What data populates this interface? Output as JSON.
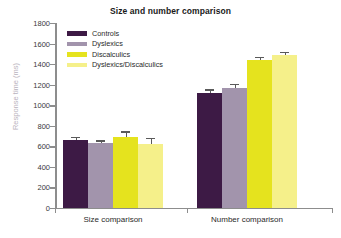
{
  "chart_data": {
    "type": "bar",
    "title": "Size and number comparison",
    "xlabel": "",
    "ylabel": "Response time (ms)",
    "ylim": [
      0,
      1800
    ],
    "ytick_step": 200,
    "yticks": [
      0,
      200,
      400,
      600,
      800,
      1000,
      1200,
      1400,
      1600,
      1800
    ],
    "grid": false,
    "legend_position": "top-left-inside",
    "categories": [
      "Size comparison",
      "Number comparison"
    ],
    "series": [
      {
        "name": "Controls",
        "color": "#3D1A45",
        "values": [
          660,
          1115
        ],
        "errors": [
          35,
          38
        ]
      },
      {
        "name": "Dyslexics",
        "color": "#A294AC",
        "values": [
          628,
          1165
        ],
        "errors": [
          30,
          42
        ]
      },
      {
        "name": "Discalculics",
        "color": "#E5E31E",
        "values": [
          690,
          1440
        ],
        "errors": [
          55,
          28
        ]
      },
      {
        "name": "Dyslexics/Discalculics",
        "color": "#F5F08A",
        "values": [
          625,
          1490
        ],
        "errors": [
          58,
          30
        ]
      }
    ]
  },
  "axis": {
    "line_color": "#8d8d8d",
    "label_color": "#3a3a3a",
    "ylabel_color": "#b9b3bd"
  }
}
